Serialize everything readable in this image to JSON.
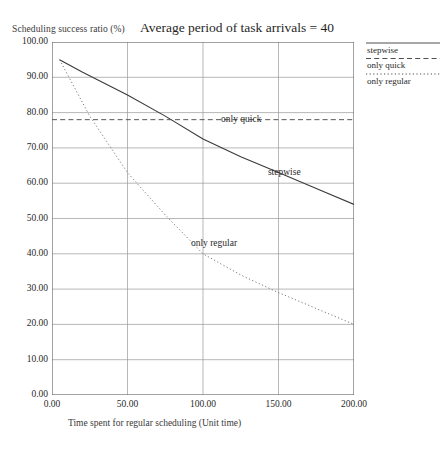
{
  "chart_data": {
    "type": "line",
    "title": "Average period of task arrivals = 40",
    "xlabel": "Time spent for regular scheduling  (Unit time)",
    "ylabel": "Scheduling success ratio (%)",
    "xlim": [
      0,
      200
    ],
    "ylim": [
      0,
      100
    ],
    "grid": true,
    "x_ticks": [
      "0.00",
      "50.00",
      "100.00",
      "150.00",
      "200.00"
    ],
    "x_tick_values": [
      0,
      50,
      100,
      150,
      200
    ],
    "y_ticks": [
      "0.00",
      "10.00",
      "20.00",
      "30.00",
      "40.00",
      "50.00",
      "60.00",
      "70.00",
      "80.00",
      "90.00",
      "100.00"
    ],
    "y_tick_values": [
      0,
      10,
      20,
      30,
      40,
      50,
      60,
      70,
      80,
      90,
      100
    ],
    "legend_position": "outside top-right",
    "series": [
      {
        "name": "stepwise",
        "style": "solid",
        "color": "#3a3a3a",
        "x": [
          5,
          20,
          50,
          75,
          100,
          125,
          150,
          175,
          200
        ],
        "values": [
          95.0,
          91.5,
          85.0,
          79.0,
          72.5,
          67.5,
          63.0,
          58.5,
          54.0
        ]
      },
      {
        "name": "only quick",
        "style": "dashed",
        "color": "#555555",
        "x": [
          0,
          200
        ],
        "values": [
          78.0,
          78.0
        ]
      },
      {
        "name": "only regular",
        "style": "dotted",
        "color": "#777777",
        "x": [
          5,
          25,
          50,
          75,
          100,
          125,
          150,
          175,
          200
        ],
        "values": [
          95.0,
          79.0,
          63.0,
          51.0,
          40.0,
          34.0,
          29.0,
          24.5,
          20.0
        ]
      }
    ],
    "annotations": [
      {
        "text": "only quick",
        "x": 112,
        "y": 77.5
      },
      {
        "text": "stepwise",
        "x": 143,
        "y": 62.5
      },
      {
        "text": "only regular",
        "x": 92,
        "y": 42.5
      }
    ]
  },
  "legend": {
    "entries": [
      {
        "label": "stepwise",
        "style": "solid"
      },
      {
        "label": "only quick",
        "style": "dashed"
      },
      {
        "label": "only regular",
        "style": "dotted"
      }
    ]
  }
}
